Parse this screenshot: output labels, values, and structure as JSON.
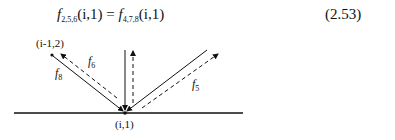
{
  "equation": {
    "lhs_func": "f",
    "lhs_sub": "2,5,6",
    "lhs_args": "(i,1)",
    "equals": "=",
    "rhs_func": "f",
    "rhs_sub": "4,7,8",
    "rhs_args": "(i,1)",
    "number": "(2.53)"
  },
  "diagram": {
    "node_top_left": "(i-1,2)",
    "node_bottom": "(i,1)",
    "labels": {
      "f6": {
        "f": "f",
        "sub": "6"
      },
      "f8": {
        "f": "f",
        "sub": "8"
      },
      "f5": {
        "f": "f",
        "sub": "5"
      }
    }
  }
}
